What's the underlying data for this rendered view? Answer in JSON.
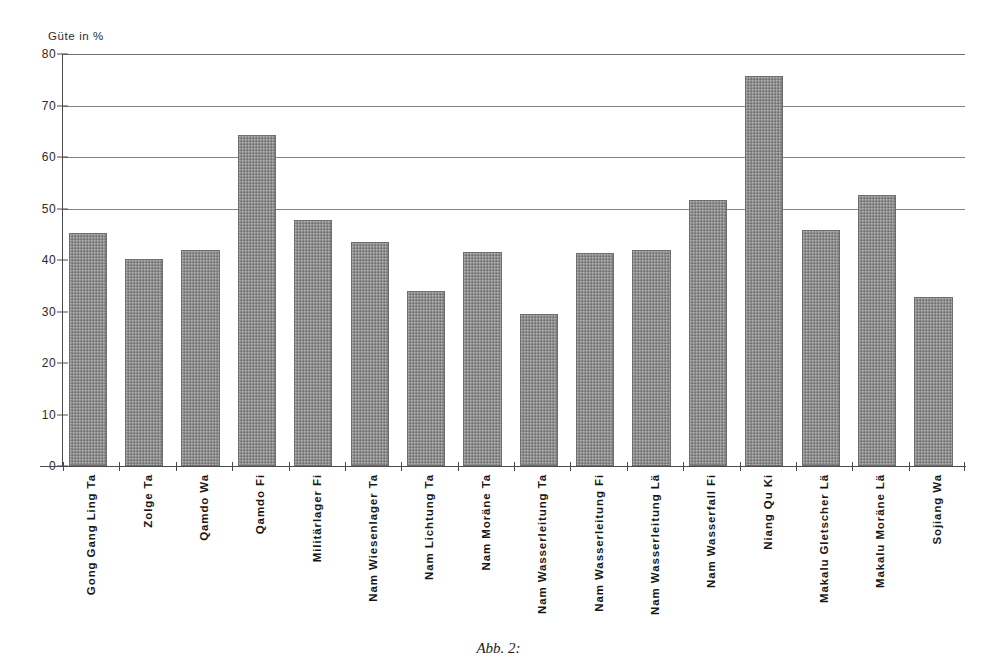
{
  "figure": {
    "caption": "Abb. 2:"
  },
  "chart_data": {
    "type": "bar",
    "title": "",
    "ylabel": "Güte in %",
    "xlabel": "",
    "ylim": [
      0,
      80
    ],
    "yticks": [
      0,
      10,
      20,
      30,
      40,
      50,
      60,
      70,
      80
    ],
    "ytick_labels": [
      "0",
      "10",
      "20",
      "30",
      "40",
      "50",
      "60",
      "70",
      "80"
    ],
    "gridlines": [
      50,
      60,
      70,
      80
    ],
    "grid": true,
    "legend": "none",
    "bar_color": "#8d8d8d",
    "categories": [
      "Gong Gang Ling Ta",
      "Zolge Ta",
      "Qamdo Wa",
      "Qamdo Fi",
      "Militärlager Fi",
      "Nam Wiesenlager Ta",
      "Nam Lichtung Ta",
      "Nam Moräne Ta",
      "Nam Wasserleitung Ta",
      "Nam Wasserleitung Fi",
      "Nam Wasserleitung Lä",
      "Nam Wasserfall Fi",
      "Niang Qu Ki",
      "Makalu Gletscher Lä",
      "Makalu Moräne Lä",
      "Sojiang Wa"
    ],
    "values": [
      45.2,
      40.2,
      41.9,
      64.2,
      47.8,
      43.5,
      34.0,
      41.6,
      29.5,
      41.3,
      42.0,
      51.6,
      75.7,
      45.9,
      52.6,
      32.9
    ]
  }
}
